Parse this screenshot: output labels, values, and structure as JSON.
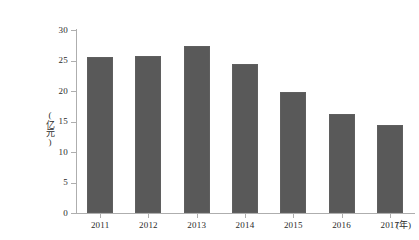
{
  "chart_data": {
    "type": "bar",
    "title": "",
    "categories": [
      "2011",
      "2012",
      "2013",
      "2014",
      "2015",
      "2016",
      "2017"
    ],
    "values": [
      25.5,
      25.8,
      27.3,
      24.4,
      19.8,
      16.2,
      14.4
    ],
    "series": [
      {
        "name": "",
        "values": [
          25.5,
          25.8,
          27.3,
          24.4,
          19.8,
          16.2,
          14.4
        ]
      }
    ],
    "xlabel": "(年)",
    "ylabel": "(亿元)",
    "ylim": [
      0,
      30
    ],
    "yticks": [
      "0",
      "5",
      "10",
      "15",
      "20",
      "25",
      "30"
    ],
    "ytick_values": [
      0,
      5,
      10,
      15,
      20,
      25,
      30
    ],
    "grid": false,
    "legend": false,
    "bar_color": "#595959",
    "axis_color": "#aeaeae",
    "background_color": "#ffffff"
  },
  "caption": {
    "text": ""
  }
}
